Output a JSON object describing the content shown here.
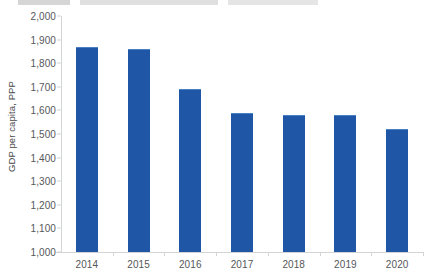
{
  "chart_data": {
    "type": "bar",
    "title": "",
    "xlabel": "",
    "ylabel": "GDP per capita, PPP",
    "categories": [
      "2014",
      "2015",
      "2016",
      "2017",
      "2018",
      "2019",
      "2020"
    ],
    "values": [
      1866,
      1857,
      1685,
      1585,
      1575,
      1578,
      1518
    ],
    "series": [
      {
        "name": "GDP per capita, PPP",
        "values": [
          1866,
          1857,
          1685,
          1585,
          1575,
          1578,
          1518
        ],
        "color": "#1F56A5"
      }
    ],
    "ylim": [
      1000,
      2000
    ],
    "ytick_step": 100,
    "ytick_labels": [
      "1,000",
      "1,100",
      "1,200",
      "1,300",
      "1,400",
      "1,500",
      "1,600",
      "1,700",
      "1,800",
      "1,900",
      "2,000"
    ],
    "ytick_values": [
      1000,
      1100,
      1200,
      1300,
      1400,
      1500,
      1600,
      1700,
      1800,
      1900,
      2000
    ],
    "grid": false,
    "legend": false,
    "legend_position": "none",
    "bar_color": "#1F56A5",
    "axis_color": "#D2D4D6",
    "tick_label_color": "#55575A",
    "background": "#FFFFFF"
  },
  "chart": {
    "y_axis_title": "GDP per capita, PPP",
    "top_text_fragment": ""
  }
}
